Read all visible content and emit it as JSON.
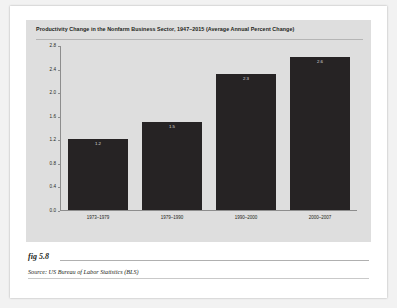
{
  "figure": {
    "number": "fig 5.8",
    "source": "Source:  US Bureau of Labor Statistics (BLS)"
  },
  "chart_data": {
    "type": "bar",
    "title": "Productivity Change in the Nonfarm Business Sector, 1947–2015 (Average Annual Percent Change)",
    "xlabel": "",
    "ylabel": "",
    "categories": [
      "1973–1979",
      "1979–1990",
      "1990–2000",
      "2000–2007"
    ],
    "values": [
      1.2,
      1.5,
      2.3,
      2.6
    ],
    "value_labels": [
      "1.2",
      "1.5",
      "2.3",
      "2.6"
    ],
    "ylim": [
      0.0,
      2.8
    ],
    "yticks": [
      "0.0",
      "0.4",
      "0.8",
      "1.2",
      "1.6",
      "2.0",
      "2.4",
      "2.8"
    ],
    "ytick_values": [
      0.0,
      0.4,
      0.8,
      1.2,
      1.6,
      2.0,
      2.4,
      2.8
    ],
    "grid": false,
    "legend": false,
    "bar_color": "#262324",
    "panel_color": "#dedede",
    "axis_color": "#8d8d8d",
    "text_color": "#231f20"
  }
}
